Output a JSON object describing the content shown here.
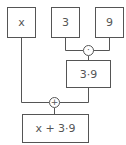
{
  "diagram": {
    "type": "expression-tree",
    "nodes": {
      "x": {
        "label": "x"
      },
      "three": {
        "label": "3"
      },
      "nine": {
        "label": "9"
      },
      "product": {
        "label": "3·9"
      },
      "sum": {
        "label": "x + 3·9"
      }
    },
    "operators": {
      "multiply": {
        "symbol": "·"
      },
      "add": {
        "symbol": "+"
      }
    },
    "edges": [
      {
        "from": "three",
        "to": "multiply"
      },
      {
        "from": "nine",
        "to": "multiply"
      },
      {
        "from": "multiply",
        "to": "product"
      },
      {
        "from": "x",
        "to": "add"
      },
      {
        "from": "product",
        "to": "add"
      },
      {
        "from": "add",
        "to": "sum"
      }
    ],
    "colors": {
      "stroke": "#555555",
      "background": "#ffffff",
      "text": "#555555"
    }
  }
}
